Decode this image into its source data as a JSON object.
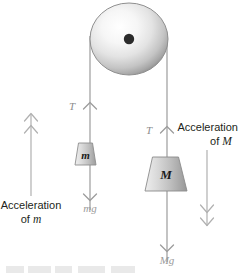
{
  "figure": {
    "background_color": "#ffffff"
  },
  "pulley": {
    "name": "pulley-wheel",
    "center_x": 129,
    "center_y": 39,
    "radius_x": 39,
    "radius_y": 36,
    "body_color": "#e8e8e8",
    "edge_color": "#8f8f8f",
    "axle_color": "#2b2b2b",
    "axle_radius": 5
  },
  "rope": {
    "color": "#9c9c9c",
    "left_x": 90,
    "right_x": 167
  },
  "left_system": {
    "tension_label": "T",
    "weight_label": "mg",
    "mass_label": "m",
    "accel_line1": "Acceleration",
    "accel_line2_prefix": "of ",
    "accel_line2_symbol": "m",
    "block_fill_light": "#e4e4e4",
    "block_fill_dark": "#a8a8a8",
    "arrow_color": "#9c9c9c"
  },
  "right_system": {
    "tension_label": "T",
    "weight_label": "Mg",
    "mass_label": "M",
    "accel_line1": "Acceleration",
    "accel_line2_prefix": "of ",
    "accel_line2_symbol": "M",
    "block_fill_light": "#e0e0e0",
    "block_fill_dark": "#a0a0a0",
    "arrow_color": "#9c9c9c"
  },
  "accel_arrows": {
    "left": {
      "name": "acceleration-arrow-m",
      "direction": "up",
      "x": 31,
      "top_y": 112,
      "bottom_y": 196,
      "color": "#b0b0b0"
    },
    "right": {
      "name": "acceleration-arrow-M",
      "direction": "down",
      "x": 207,
      "top_y": 150,
      "bottom_y": 228,
      "color": "#b0b0b0"
    }
  },
  "colors": {
    "text_black": "#231f20",
    "text_gray": "#8c8c8c",
    "line_gray": "#9c9c9c",
    "accel_gray": "#b0b0b0"
  }
}
